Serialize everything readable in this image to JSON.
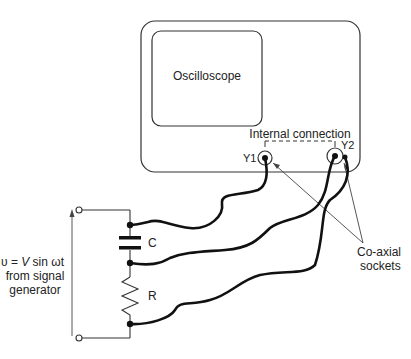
{
  "diagram": {
    "oscilloscope": {
      "label": "Oscilloscope",
      "internal_connection_label": "Internal connection",
      "socket_y1_label": "Y1",
      "socket_y2_label": "Y2"
    },
    "annotation": {
      "coaxial_line1": "Co-axial",
      "coaxial_line2": "sockets"
    },
    "circuit": {
      "capacitor_label": "C",
      "resistor_label": "R"
    },
    "source": {
      "line1_prefix": "υ = ",
      "line1_italic": "V",
      "line1_suffix": " sin ωt",
      "line2": "from signal",
      "line3": "generator"
    },
    "colors": {
      "stroke": "#222222",
      "thin": "#444444",
      "background": "#ffffff"
    }
  }
}
